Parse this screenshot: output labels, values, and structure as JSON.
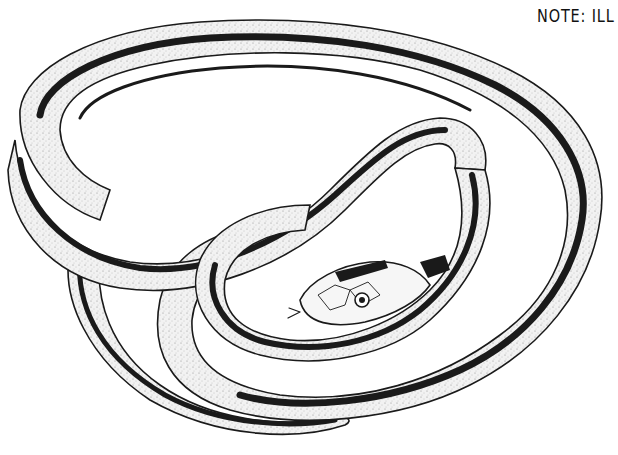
{
  "note": {
    "text": "NOTE: ILL"
  },
  "illustration": {
    "subject": "coiled striped snake (pen-and-ink stipple drawing)",
    "palette": {
      "background": "#ffffff",
      "ink": "#1a1a1a",
      "body_fill": "#efefef",
      "stipple": "#8a8a8a"
    }
  }
}
